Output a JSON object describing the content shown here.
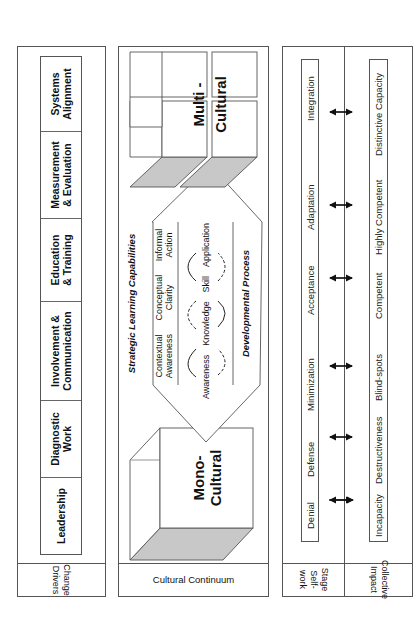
{
  "rows": {
    "change_drivers": {
      "label": "Change Drivers",
      "label_lines": [
        "Change",
        "Drivers"
      ],
      "items": [
        {
          "lines": [
            "Leadership"
          ]
        },
        {
          "lines": [
            "Diagnostic",
            "Work"
          ]
        },
        {
          "lines": [
            "Involvement &",
            "Communication"
          ]
        },
        {
          "lines": [
            "Education",
            "& Training"
          ]
        },
        {
          "lines": [
            "Measurement",
            "& Evaluation"
          ]
        },
        {
          "lines": [
            "Systems",
            "Alignment"
          ]
        }
      ]
    },
    "cultural_continuum": {
      "label": "Cultural Continuum",
      "mono": {
        "line1": "Mono-",
        "line2": "Cultural"
      },
      "multi": {
        "line1": "Multi -",
        "line2": "Cultural"
      },
      "capabilities_title": "Strategic Learning Capabilities",
      "capabilities": [
        {
          "line1": "Contextual",
          "line2": "Awareness"
        },
        {
          "line1": "Conceptual",
          "line2": "Clarity"
        },
        {
          "line1": "Informal",
          "line2": "Action"
        }
      ],
      "process_steps": [
        "Awareness",
        "Knowledge",
        "Skill",
        "Application"
      ],
      "process_title": "Developmental Process"
    },
    "stage_self_work": {
      "label": "Stage Self-work",
      "label_lines": [
        "Stage",
        "Self-work"
      ],
      "items": [
        "Denial",
        "Defense",
        "Minimization",
        "Acceptance",
        "Adaptation",
        "Integration"
      ]
    },
    "collective_impact": {
      "label": "Collective Impact",
      "label_lines": [
        "Collective",
        "Impact"
      ],
      "items": [
        "Incapacity",
        "Destructiveness",
        "Blind-spots",
        "Competent",
        "Highly Competent",
        "Distinctive Capacity"
      ]
    }
  },
  "colors": {
    "border": "#555555",
    "shade": "#c8c8c8",
    "text": "#111111"
  }
}
